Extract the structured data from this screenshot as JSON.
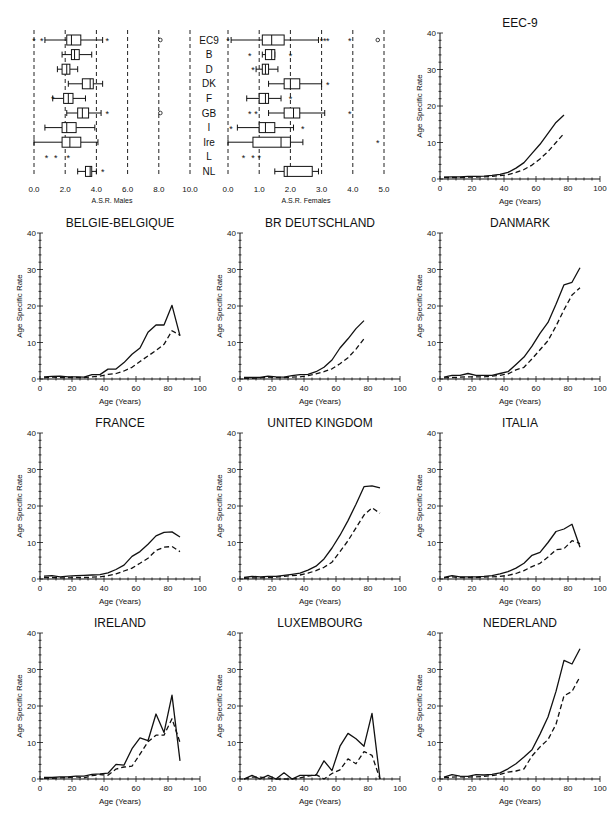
{
  "boxplots": {
    "males": {
      "xlabel": "A.S.R. Males",
      "ticks": [
        "0.0",
        "2.0",
        "4.0",
        "6.0",
        "8.0",
        "10.0"
      ],
      "range": [
        0,
        10
      ],
      "rows": [
        {
          "label": "EC9",
          "q1": 2.1,
          "med": 2.4,
          "q3": 3.0,
          "lo": 0.7,
          "hi": 4.4,
          "out": [
            0.0,
            0.5,
            4.7
          ],
          "circ": [
            8.1
          ]
        },
        {
          "label": "B",
          "q1": 2.4,
          "med": 2.6,
          "q3": 2.9,
          "lo": 1.8,
          "hi": 3.7,
          "out": [],
          "circ": []
        },
        {
          "label": "D",
          "q1": 1.8,
          "med": 2.1,
          "q3": 2.3,
          "lo": 1.5,
          "hi": 2.8,
          "out": [],
          "circ": []
        },
        {
          "label": "DK",
          "q1": 3.1,
          "med": 3.6,
          "q3": 3.8,
          "lo": 2.2,
          "hi": 4.4,
          "out": [],
          "circ": []
        },
        {
          "label": "F",
          "q1": 1.9,
          "med": 2.2,
          "q3": 2.5,
          "lo": 1.2,
          "hi": 3.3,
          "out": [
            1.2
          ],
          "circ": []
        },
        {
          "label": "GB",
          "q1": 2.8,
          "med": 3.1,
          "q3": 3.5,
          "lo": 2.1,
          "hi": 4.3,
          "out": [
            4.7
          ],
          "circ": [
            8.1
          ]
        },
        {
          "label": "I",
          "q1": 1.8,
          "med": 2.1,
          "q3": 2.7,
          "lo": 0.7,
          "hi": 3.9,
          "out": [],
          "circ": []
        },
        {
          "label": "Ire",
          "q1": 1.8,
          "med": 2.3,
          "q3": 3.0,
          "lo": 0.0,
          "hi": 4.1,
          "out": [],
          "circ": []
        },
        {
          "label": "L",
          "q1": null,
          "med": null,
          "q3": null,
          "lo": null,
          "hi": null,
          "out": [
            0.8,
            1.4,
            2.2
          ],
          "circ": []
        },
        {
          "label": "NL",
          "q1": 3.3,
          "med": 3.6,
          "q3": 3.7,
          "lo": 2.8,
          "hi": 4.0,
          "out": [
            4.4
          ],
          "circ": []
        }
      ]
    },
    "females": {
      "xlabel": "A.S.R. Females",
      "ticks": [
        "0.0",
        "1.0",
        "2.0",
        "3.0",
        "4.0",
        "5.0"
      ],
      "range": [
        0,
        5
      ],
      "rows": [
        {
          "label": "EC9",
          "q1": 1.1,
          "med": 1.4,
          "q3": 1.8,
          "lo": 0.1,
          "hi": 2.9,
          "out": [
            0.0,
            3.0,
            3.1,
            3.2,
            3.9
          ],
          "circ": [
            4.8
          ]
        },
        {
          "label": "B",
          "q1": 1.2,
          "med": 1.4,
          "q3": 1.5,
          "lo": 1.1,
          "hi": 1.5,
          "out": [
            0.7,
            2.0
          ],
          "circ": []
        },
        {
          "label": "D",
          "q1": 1.1,
          "med": 1.2,
          "q3": 1.3,
          "lo": 0.9,
          "hi": 1.6,
          "out": [
            0.8
          ],
          "circ": []
        },
        {
          "label": "DK",
          "q1": 1.8,
          "med": 2.0,
          "q3": 2.3,
          "lo": 1.3,
          "hi": 3.0,
          "out": [
            3.2
          ],
          "circ": []
        },
        {
          "label": "F",
          "q1": 1.0,
          "med": 1.2,
          "q3": 1.3,
          "lo": 0.6,
          "hi": 1.7,
          "out": [
            2.0
          ],
          "circ": []
        },
        {
          "label": "GB",
          "q1": 1.8,
          "med": 2.1,
          "q3": 2.3,
          "lo": 1.3,
          "hi": 3.1,
          "out": [
            0.7,
            0.9,
            3.9
          ],
          "circ": []
        },
        {
          "label": "I",
          "q1": 1.0,
          "med": 1.2,
          "q3": 1.5,
          "lo": 0.3,
          "hi": 2.1,
          "out": [
            0.1,
            2.4
          ],
          "circ": []
        },
        {
          "label": "Ire",
          "q1": 0.8,
          "med": 1.7,
          "q3": 2.0,
          "lo": 0.0,
          "hi": 2.4,
          "out": [
            4.8
          ],
          "circ": []
        },
        {
          "label": "L",
          "q1": null,
          "med": null,
          "q3": null,
          "lo": null,
          "hi": null,
          "out": [
            0.5,
            0.8,
            1.0
          ],
          "circ": []
        },
        {
          "label": "NL",
          "q1": 1.8,
          "med": 1.9,
          "q3": 2.7,
          "lo": 1.5,
          "hi": 2.9,
          "out": [],
          "circ": []
        }
      ]
    }
  },
  "line_common": {
    "ylabel": "Age Specific Rate",
    "xlabel": "Age (Years)",
    "xticks": [
      "0",
      "20",
      "40",
      "60",
      "80",
      "100"
    ],
    "yticks": [
      "0",
      "10",
      "20",
      "30",
      "40"
    ]
  },
  "chart_data": [
    {
      "type": "box",
      "title": "",
      "xlabel": "A.S.R. Males",
      "categories": [
        "EC9",
        "B",
        "D",
        "DK",
        "F",
        "GB",
        "I",
        "Ire",
        "L",
        "NL"
      ],
      "xlim": [
        0,
        10
      ]
    },
    {
      "type": "box",
      "title": "",
      "xlabel": "A.S.R. Females",
      "categories": [
        "EC9",
        "B",
        "D",
        "DK",
        "F",
        "GB",
        "I",
        "Ire",
        "L",
        "NL"
      ],
      "xlim": [
        0,
        5
      ]
    },
    {
      "type": "line",
      "title": "EEC-9",
      "xlabel": "Age (Years)",
      "ylabel": "Age Specific Rate",
      "xlim": [
        0,
        100
      ],
      "ylim": [
        0,
        40
      ],
      "x": [
        2.5,
        7.5,
        12.5,
        17.5,
        22.5,
        27.5,
        32.5,
        37.5,
        42.5,
        47.5,
        52.5,
        57.5,
        62.5,
        67.5,
        72.5,
        77.5
      ],
      "series": [
        {
          "name": "solid",
          "values": [
            0.5,
            0.6,
            0.6,
            0.7,
            0.7,
            0.8,
            1.0,
            1.3,
            1.8,
            3.0,
            4.5,
            7.0,
            9.5,
            12.5,
            15.5,
            17.5
          ]
        },
        {
          "name": "dashed",
          "values": [
            0.4,
            0.4,
            0.4,
            0.5,
            0.5,
            0.6,
            0.7,
            0.9,
            1.2,
            1.8,
            2.6,
            3.8,
            5.5,
            7.5,
            10.0,
            12.5
          ]
        }
      ]
    },
    {
      "type": "line",
      "title": "BELGIE-BELGIQUE",
      "xlabel": "Age (Years)",
      "ylabel": "Age Specific Rate",
      "xlim": [
        0,
        100
      ],
      "ylim": [
        0,
        40
      ],
      "x": [
        2.5,
        7.5,
        12.5,
        17.5,
        22.5,
        27.5,
        32.5,
        37.5,
        42.5,
        47.5,
        52.5,
        57.5,
        62.5,
        67.5,
        72.5,
        77.5,
        82.5,
        87.5
      ],
      "series": [
        {
          "name": "solid",
          "values": [
            0.6,
            0.7,
            0.8,
            0.6,
            0.6,
            0.5,
            1.2,
            1.2,
            2.7,
            2.7,
            4.5,
            6.8,
            8.5,
            12.8,
            14.8,
            14.8,
            20.2,
            11.8
          ]
        },
        {
          "name": "dashed",
          "values": [
            0.3,
            0.5,
            0.4,
            0.4,
            0.4,
            0.4,
            0.6,
            0.8,
            1.3,
            1.5,
            2.2,
            3.2,
            4.8,
            6.3,
            7.8,
            9.5,
            13.2,
            12.0
          ]
        }
      ]
    },
    {
      "type": "line",
      "title": "BR DEUTSCHLAND",
      "xlabel": "Age (Years)",
      "ylabel": "Age Specific Rate",
      "xlim": [
        0,
        100
      ],
      "ylim": [
        0,
        40
      ],
      "x": [
        2.5,
        7.5,
        12.5,
        17.5,
        22.5,
        27.5,
        32.5,
        37.5,
        42.5,
        47.5,
        52.5,
        57.5,
        62.5,
        67.5,
        72.5,
        77.5
      ],
      "series": [
        {
          "name": "solid",
          "values": [
            0.4,
            0.4,
            0.4,
            0.8,
            0.6,
            0.5,
            0.9,
            1.2,
            1.3,
            2.0,
            3.2,
            5.2,
            8.5,
            11.0,
            13.8,
            16.0
          ]
        },
        {
          "name": "dashed",
          "values": [
            0.2,
            0.2,
            0.3,
            0.5,
            0.4,
            0.4,
            0.5,
            0.6,
            0.9,
            1.4,
            2.0,
            2.8,
            4.2,
            5.8,
            8.2,
            11.0
          ]
        }
      ]
    },
    {
      "type": "line",
      "title": "DANMARK",
      "xlabel": "Age (Years)",
      "ylabel": "Age Specific Rate",
      "xlim": [
        0,
        100
      ],
      "ylim": [
        0,
        40
      ],
      "x": [
        2.5,
        7.5,
        12.5,
        17.5,
        22.5,
        27.5,
        32.5,
        37.5,
        42.5,
        47.5,
        52.5,
        57.5,
        62.5,
        67.5,
        72.5,
        77.5,
        82.5,
        87.5
      ],
      "series": [
        {
          "name": "solid",
          "values": [
            0.5,
            1.0,
            1.0,
            1.5,
            1.0,
            1.0,
            1.0,
            1.5,
            2.0,
            4.0,
            6.0,
            9.0,
            12.5,
            15.5,
            20.5,
            25.8,
            26.5,
            30.5
          ]
        },
        {
          "name": "dashed",
          "values": [
            0.3,
            0.4,
            0.5,
            0.6,
            0.6,
            0.6,
            0.8,
            1.0,
            1.4,
            2.5,
            3.2,
            5.5,
            8.0,
            10.5,
            14.5,
            19.0,
            23.0,
            25.0
          ]
        }
      ]
    },
    {
      "type": "line",
      "title": "FRANCE",
      "xlabel": "Age (Years)",
      "ylabel": "Age Specific Rate",
      "xlim": [
        0,
        100
      ],
      "ylim": [
        0,
        40
      ],
      "x": [
        2.5,
        7.5,
        12.5,
        17.5,
        22.5,
        27.5,
        32.5,
        37.5,
        42.5,
        47.5,
        52.5,
        57.5,
        62.5,
        67.5,
        72.5,
        77.5,
        82.5,
        87.5
      ],
      "series": [
        {
          "name": "solid",
          "values": [
            0.8,
            0.9,
            0.6,
            0.8,
            0.9,
            1.0,
            1.1,
            1.2,
            1.7,
            2.6,
            3.8,
            6.2,
            7.5,
            9.5,
            11.8,
            12.8,
            12.9,
            11.5
          ]
        },
        {
          "name": "dashed",
          "values": [
            0.4,
            0.4,
            0.3,
            0.3,
            0.4,
            0.4,
            0.5,
            0.6,
            0.9,
            1.4,
            2.2,
            3.0,
            4.3,
            5.7,
            7.8,
            8.7,
            8.9,
            7.5
          ]
        }
      ]
    },
    {
      "type": "line",
      "title": "UNITED KINGDOM",
      "xlabel": "Age (Years)",
      "ylabel": "Age Specific Rate",
      "xlim": [
        0,
        100
      ],
      "ylim": [
        0,
        40
      ],
      "x": [
        2.5,
        7.5,
        12.5,
        17.5,
        22.5,
        27.5,
        32.5,
        37.5,
        42.5,
        47.5,
        52.5,
        57.5,
        62.5,
        67.5,
        72.5,
        77.5,
        82.5,
        87.5
      ],
      "series": [
        {
          "name": "solid",
          "values": [
            0.4,
            0.7,
            0.6,
            0.7,
            0.7,
            1.0,
            1.3,
            1.6,
            2.4,
            3.5,
            5.5,
            8.5,
            12.0,
            16.0,
            20.5,
            25.3,
            25.5,
            25.0
          ]
        },
        {
          "name": "dashed",
          "values": [
            0.2,
            0.3,
            0.3,
            0.4,
            0.5,
            0.7,
            0.9,
            1.1,
            1.6,
            2.3,
            3.2,
            4.6,
            7.5,
            10.5,
            14.0,
            17.5,
            19.5,
            18.0
          ]
        }
      ]
    },
    {
      "type": "line",
      "title": "ITALIA",
      "xlabel": "Age (Years)",
      "ylabel": "Age Specific Rate",
      "xlim": [
        0,
        100
      ],
      "ylim": [
        0,
        40
      ],
      "x": [
        2.5,
        7.5,
        12.5,
        17.5,
        22.5,
        27.5,
        32.5,
        37.5,
        42.5,
        47.5,
        52.5,
        57.5,
        62.5,
        67.5,
        72.5,
        77.5,
        82.5,
        87.5
      ],
      "series": [
        {
          "name": "solid",
          "values": [
            0.4,
            0.9,
            0.6,
            0.6,
            0.6,
            0.7,
            0.9,
            1.4,
            2.0,
            3.0,
            4.3,
            6.5,
            7.3,
            10.0,
            13.0,
            13.7,
            15.0,
            8.7
          ]
        },
        {
          "name": "dashed",
          "values": [
            0.3,
            0.6,
            0.4,
            0.4,
            0.4,
            0.5,
            0.6,
            0.7,
            1.0,
            1.5,
            2.3,
            3.4,
            4.3,
            6.0,
            8.0,
            8.3,
            10.5,
            9.7
          ]
        }
      ]
    },
    {
      "type": "line",
      "title": "IRELAND",
      "xlabel": "Age (Years)",
      "ylabel": "Age Specific Rate",
      "xlim": [
        0,
        100
      ],
      "ylim": [
        0,
        40
      ],
      "x": [
        2.5,
        7.5,
        12.5,
        17.5,
        22.5,
        27.5,
        32.5,
        37.5,
        42.5,
        47.5,
        52.5,
        57.5,
        62.5,
        67.5,
        72.5,
        77.5,
        82.5,
        87.5
      ],
      "series": [
        {
          "name": "solid",
          "values": [
            0.4,
            0.4,
            0.6,
            0.6,
            0.8,
            0.8,
            1.3,
            1.4,
            1.6,
            4.0,
            3.8,
            8.3,
            11.3,
            10.5,
            17.8,
            12.7,
            23.0,
            5.0
          ]
        },
        {
          "name": "dashed",
          "values": [
            0.2,
            0.2,
            0.3,
            0.4,
            0.6,
            0.3,
            0.9,
            1.2,
            1.0,
            2.7,
            3.3,
            3.5,
            6.8,
            10.2,
            12.0,
            12.0,
            16.5,
            10.0
          ]
        }
      ]
    },
    {
      "type": "line",
      "title": "LUXEMBOURG",
      "xlabel": "Age (Years)",
      "ylabel": "Age Specific Rate",
      "xlim": [
        0,
        100
      ],
      "ylim": [
        0,
        40
      ],
      "x": [
        2.5,
        7.5,
        12.5,
        17.5,
        22.5,
        27.5,
        32.5,
        37.5,
        42.5,
        47.5,
        52.5,
        57.5,
        62.5,
        67.5,
        72.5,
        77.5,
        82.5,
        87.5
      ],
      "series": [
        {
          "name": "solid",
          "values": [
            0,
            1.0,
            0,
            1.0,
            0,
            1.7,
            0,
            1.0,
            1.0,
            1.0,
            5.0,
            2.3,
            9.0,
            12.5,
            11.0,
            9.0,
            18.0,
            0
          ]
        },
        {
          "name": "dashed",
          "values": [
            0,
            0.5,
            0.5,
            0.3,
            0,
            0,
            0,
            0.3,
            0.8,
            1.2,
            0,
            1.5,
            2.5,
            5.5,
            4.2,
            7.5,
            6.5,
            0
          ]
        }
      ]
    },
    {
      "type": "line",
      "title": "NEDERLAND",
      "xlabel": "Age (Years)",
      "ylabel": "Age Specific Rate",
      "xlim": [
        0,
        100
      ],
      "ylim": [
        0,
        40
      ],
      "x": [
        2.5,
        7.5,
        12.5,
        17.5,
        22.5,
        27.5,
        32.5,
        37.5,
        42.5,
        47.5,
        52.5,
        57.5,
        62.5,
        67.5,
        72.5,
        77.5,
        82.5,
        87.5
      ],
      "series": [
        {
          "name": "solid",
          "values": [
            0.5,
            1.2,
            0.8,
            0.7,
            1.2,
            1.1,
            1.3,
            1.7,
            2.8,
            4.2,
            6.0,
            8.0,
            12.3,
            17.0,
            24.0,
            32.5,
            31.5,
            35.7
          ]
        },
        {
          "name": "dashed",
          "values": [
            0.4,
            0.5,
            0.6,
            0.5,
            0.6,
            0.7,
            0.9,
            1.3,
            1.9,
            2.2,
            2.8,
            6.3,
            8.8,
            10.8,
            15.0,
            22.8,
            24.0,
            28.0
          ]
        }
      ]
    }
  ],
  "panels_layout": [
    {
      "idx": 2,
      "left": 400,
      "top": 15
    },
    {
      "idx": 3,
      "left": 0,
      "top": 215
    },
    {
      "idx": 4,
      "left": 200,
      "top": 215
    },
    {
      "idx": 5,
      "left": 400,
      "top": 215
    },
    {
      "idx": 6,
      "left": 0,
      "top": 415
    },
    {
      "idx": 7,
      "left": 200,
      "top": 415
    },
    {
      "idx": 8,
      "left": 400,
      "top": 415
    },
    {
      "idx": 9,
      "left": 0,
      "top": 615
    },
    {
      "idx": 10,
      "left": 200,
      "top": 615
    },
    {
      "idx": 11,
      "left": 400,
      "top": 615
    }
  ]
}
